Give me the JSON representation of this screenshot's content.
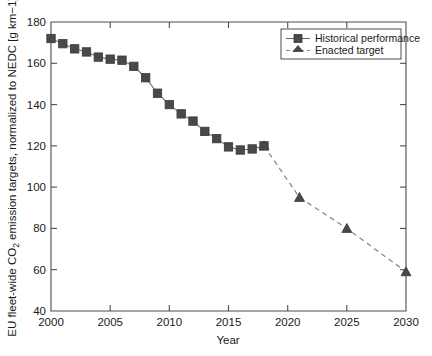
{
  "chart_data": {
    "type": "line",
    "title": "",
    "xlabel": "Year",
    "ylabel": "EU fleet-wide CO₂ emission targets, normalized to NEDC [g km−1]",
    "xlim": [
      2000,
      2030
    ],
    "ylim": [
      40,
      180
    ],
    "xticks": [
      2000,
      2005,
      2010,
      2015,
      2020,
      2025,
      2030
    ],
    "xticklabels": [
      "2000",
      "2005",
      "2010",
      "2015",
      "2020",
      "2025",
      "2030"
    ],
    "yticks": [
      40,
      60,
      80,
      100,
      120,
      140,
      160,
      180
    ],
    "yticklabels": [
      "40",
      "60",
      "80",
      "100",
      "120",
      "140",
      "160",
      "180"
    ],
    "grid": false,
    "legend_position": "top-right",
    "series": [
      {
        "name": "Historical performance",
        "marker": "square",
        "linestyle": "solid",
        "color": "#494949",
        "x": [
          2000,
          2001,
          2002,
          2003,
          2004,
          2005,
          2006,
          2007,
          2008,
          2009,
          2010,
          2011,
          2012,
          2013,
          2014,
          2015,
          2016,
          2017,
          2018
        ],
        "values": [
          172,
          169.5,
          167,
          165.5,
          163,
          162,
          161.5,
          158.5,
          153,
          145.5,
          140,
          135.5,
          132,
          127,
          123.5,
          119.5,
          118,
          118.5,
          120
        ]
      },
      {
        "name": "Enacted target",
        "marker": "triangle",
        "linestyle": "dashed",
        "color": "#494949",
        "x": [
          2018,
          2021,
          2025,
          2030
        ],
        "values": [
          120,
          95,
          80,
          59
        ]
      }
    ]
  },
  "legend": {
    "entries": [
      {
        "label": "Historical performance"
      },
      {
        "label": "Enacted target"
      }
    ]
  },
  "axis": {
    "x_title": "Year",
    "y_title_parts": {
      "prefix": "EU fleet-wide CO",
      "subscript": "2",
      "suffix": " emission targets, normalized to NEDC [g km−1]"
    }
  }
}
